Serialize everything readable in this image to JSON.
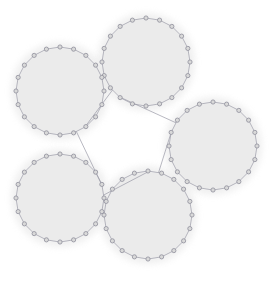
{
  "figure": {
    "width": 269,
    "height": 284,
    "background_color": "#ffffff"
  },
  "style": {
    "node_fill": "#d9d9d9",
    "node_stroke": "#8f8f9c",
    "node_radius": 2.1,
    "node_stroke_width": 0.8,
    "ring_edge_color": "#9a9aa6",
    "ring_edge_width": 0.7,
    "bridge_edge_color": "#9a9aa6",
    "bridge_edge_width": 0.7,
    "cluster_fill": "#ebebeb",
    "cluster_halo_fill": "#e4e4e4",
    "cluster_halo_opacity": 0.55
  },
  "graph": {
    "type": "network",
    "description": "Five 20-node ring (cycle) clusters arranged at the vertices of a pentagon, joined by five bridge edges that form an inner pentagon.",
    "cluster_count": 5,
    "nodes_per_cluster": 20,
    "total_nodes": 100,
    "total_edges": 105,
    "ring_edges": 100,
    "bridge_edges": 5,
    "clusters": [
      {
        "id": "C0",
        "label": "top",
        "cx": 146,
        "cy": 62,
        "r": 44,
        "halo_r": 49,
        "node_count": 20,
        "start_angle_deg": -90,
        "bridge_node_index": 12,
        "bridge_node_index_b": 13
      },
      {
        "id": "C1",
        "label": "right",
        "cx": 213,
        "cy": 146,
        "r": 44,
        "halo_r": 49,
        "node_count": 20,
        "start_angle_deg": -90,
        "bridge_node_index": 16,
        "bridge_node_index_b": 17
      },
      {
        "id": "C2",
        "label": "bottom",
        "cx": 148,
        "cy": 215,
        "r": 44,
        "halo_r": 49,
        "node_count": 20,
        "start_angle_deg": -90,
        "bridge_node_index": 0,
        "bridge_node_index_b": 1
      },
      {
        "id": "C3",
        "label": "bottom-left",
        "cx": 60,
        "cy": 198,
        "r": 44,
        "halo_r": 49,
        "node_count": 20,
        "start_angle_deg": -90,
        "bridge_node_index": 4,
        "bridge_node_index_b": 5
      },
      {
        "id": "C4",
        "label": "left",
        "cx": 60,
        "cy": 91,
        "r": 44,
        "halo_r": 49,
        "node_count": 20,
        "start_angle_deg": -90,
        "bridge_node_index": 8,
        "bridge_node_index_b": 9
      }
    ],
    "bridges": [
      {
        "id": "B0",
        "from_cluster": "C0",
        "from_angle_deg": 128,
        "to_cluster": "C1",
        "to_angle_deg": 212
      },
      {
        "id": "B1",
        "from_cluster": "C1",
        "from_angle_deg": 200,
        "to_cluster": "C2",
        "to_angle_deg": 284
      },
      {
        "id": "B2",
        "from_cluster": "C2",
        "from_angle_deg": 272,
        "to_cluster": "C3",
        "to_angle_deg": 356
      },
      {
        "id": "B3",
        "from_cluster": "C3",
        "from_angle_deg": 344,
        "to_cluster": "C4",
        "to_angle_deg": 68
      },
      {
        "id": "B4",
        "from_cluster": "C4",
        "from_angle_deg": 56,
        "to_cluster": "C0",
        "to_angle_deg": 140
      }
    ]
  }
}
